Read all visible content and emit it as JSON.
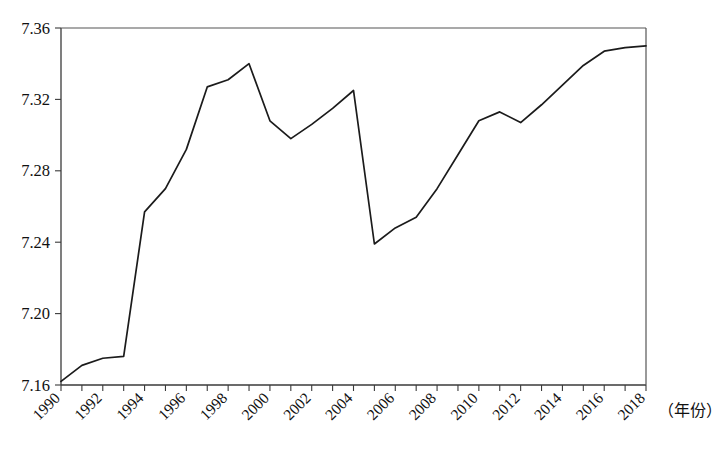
{
  "chart_data": {
    "type": "line",
    "title": "",
    "subtitle": "",
    "xlabel": "（年份）",
    "ylabel": "",
    "x": [
      1990,
      1991,
      1992,
      1993,
      1994,
      1995,
      1996,
      1997,
      1998,
      1999,
      2000,
      2001,
      2002,
      2003,
      2004,
      2005,
      2006,
      2007,
      2008,
      2009,
      2010,
      2011,
      2012,
      2013,
      2014,
      2015,
      2016,
      2017,
      2018
    ],
    "series": [
      {
        "name": "series-1",
        "values": [
          7.162,
          7.171,
          7.175,
          7.176,
          7.257,
          7.27,
          7.292,
          7.327,
          7.331,
          7.34,
          7.308,
          7.298,
          7.306,
          7.315,
          7.325,
          7.239,
          7.248,
          7.254,
          7.27,
          7.289,
          7.308,
          7.313,
          7.307,
          7.317,
          7.328,
          7.339,
          7.347,
          7.349,
          7.35
        ]
      }
    ],
    "xlim": [
      1990,
      2018
    ],
    "ylim": [
      7.16,
      7.36
    ],
    "xticks": [
      1990,
      1991,
      1992,
      1993,
      1994,
      1995,
      1996,
      1997,
      1998,
      1999,
      2000,
      2001,
      2002,
      2003,
      2004,
      2005,
      2006,
      2007,
      2008,
      2009,
      2010,
      2011,
      2012,
      2013,
      2014,
      2015,
      2016,
      2017,
      2018
    ],
    "xtick_labels": [
      "1990",
      "",
      "1992",
      "",
      "1994",
      "",
      "1996",
      "",
      "1998",
      "",
      "2000",
      "",
      "2002",
      "",
      "2004",
      "",
      "2006",
      "",
      "2008",
      "",
      "2010",
      "",
      "2012",
      "",
      "2014",
      "",
      "2016",
      "",
      "2018"
    ],
    "yticks": [
      7.16,
      7.2,
      7.24,
      7.28,
      7.32,
      7.36
    ],
    "ytick_labels": [
      "7.16",
      "7.20",
      "7.24",
      "7.28",
      "7.32",
      "7.36"
    ],
    "grid": false,
    "legend": false,
    "legend_position": "none",
    "line_color": "#1b1b1b",
    "axis_color": "#3a3a3a",
    "background_color": "#ffffff",
    "xtick_label_rotation": -45
  },
  "plot_geometry": {
    "left": 61,
    "right": 646,
    "top": 28,
    "bottom": 385
  },
  "annotations": {
    "x_unit_text": "（年份）",
    "x_unit_x": 658,
    "x_unit_y": 416
  },
  "caption": {
    "ghost_text": ""
  }
}
